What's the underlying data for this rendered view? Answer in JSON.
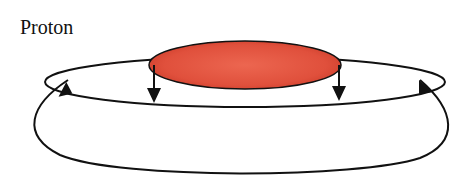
{
  "diagram": {
    "title": "Proton",
    "colors": {
      "disc_fill_center": "#e85a48",
      "disc_fill_edge": "#d6422f",
      "line": "#111111",
      "background": "#ffffff"
    },
    "elements": {
      "disc": "red disc (proton)",
      "inner_loop": "inner field loop",
      "outer_loop": "outer field loop",
      "arrows": [
        "down-left",
        "down-right",
        "up-left",
        "up-right"
      ]
    }
  }
}
